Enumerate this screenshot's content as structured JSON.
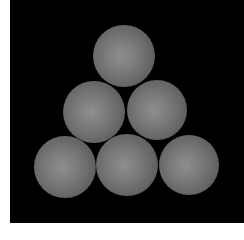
{
  "image": {
    "description": "Six gray spheres stacked in a triangular arrangement (1-2-3) on a black background",
    "background_color": "#000000",
    "sphere_color": "#7a7a7a",
    "spheres": [
      {
        "row": 1,
        "cx": 124,
        "cy": 56,
        "r": 31
      },
      {
        "row": 2,
        "cx": 94,
        "cy": 112,
        "r": 31
      },
      {
        "row": 2,
        "cx": 157,
        "cy": 110,
        "r": 30
      },
      {
        "row": 3,
        "cx": 65,
        "cy": 167,
        "r": 31
      },
      {
        "row": 3,
        "cx": 127,
        "cy": 165,
        "r": 31
      },
      {
        "row": 3,
        "cx": 189,
        "cy": 165,
        "r": 30
      }
    ]
  }
}
